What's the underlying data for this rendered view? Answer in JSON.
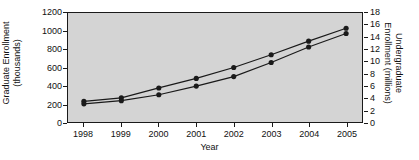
{
  "chart_data": {
    "type": "line",
    "title": "",
    "xlabel": "Year",
    "ylabel": "Graduate Enrollment (thousands)",
    "ylabel_line1": "Graduate Enrollment",
    "ylabel_line2": "(thousands)",
    "y2label": "Undergraduate Enrollment (millions)",
    "y2label_line1": "Undergraduate",
    "y2label_line2": "Enrollment (millions)",
    "categories": [
      "1998",
      "1999",
      "2000",
      "2001",
      "2002",
      "2003",
      "2004",
      "2005"
    ],
    "x": [
      1998,
      1999,
      2000,
      2001,
      2002,
      2003,
      2004,
      2005
    ],
    "xlim": [
      1998,
      2005
    ],
    "ylim": [
      0,
      1200
    ],
    "y2lim": [
      0,
      18
    ],
    "yticks": [
      0,
      200,
      400,
      600,
      800,
      1000,
      1200
    ],
    "ytick_labels": [
      "0",
      "200",
      "400",
      "600",
      "800",
      "1000",
      "1200"
    ],
    "y2ticks": [
      0,
      2,
      4,
      6,
      8,
      10,
      12,
      14,
      16,
      18
    ],
    "y2tick_labels": [
      "0",
      "2",
      "4",
      "6",
      "8",
      "10",
      "12",
      "14",
      "16",
      "18"
    ],
    "grid": false,
    "legend": "none",
    "marker": "circle",
    "line_color": "#1a1a1a",
    "marker_color": "#1a1a1a",
    "plot_background": "#d4d4d4",
    "figure_background": "#ffffff",
    "series": [
      {
        "name": "Undergraduate Enrollment (millions)",
        "axis": "right",
        "values": [
          3.4,
          4.0,
          5.6,
          7.2,
          9.0,
          11.1,
          13.3,
          15.5
        ],
        "values_on_left_scale": [
          228,
          266,
          375,
          480,
          600,
          740,
          890,
          1032
        ]
      },
      {
        "name": "Graduate Enrollment (thousands)",
        "axis": "left",
        "values": [
          200,
          235,
          300,
          395,
          500,
          655,
          825,
          975
        ]
      }
    ]
  }
}
